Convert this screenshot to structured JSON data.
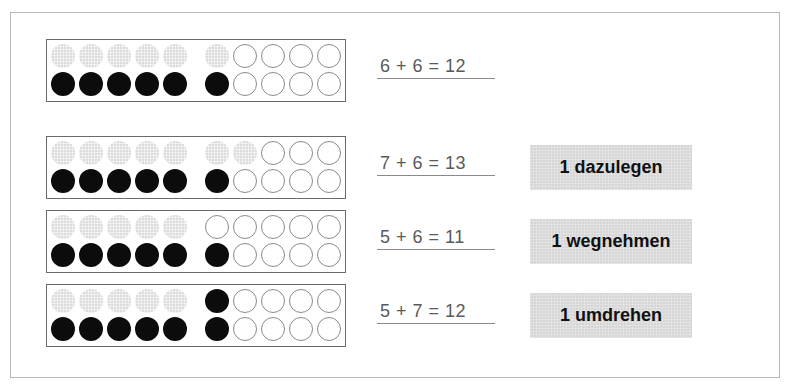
{
  "diagram": {
    "type": "twenty-frame addition exercise",
    "colors": {
      "black_counter": "#0c0c0c",
      "grey_counter": "#dcdcdc",
      "empty_counter": "#ffffff",
      "label_background": "#d6d6d6"
    },
    "rows": [
      {
        "top_row": [
          "grey",
          "grey",
          "grey",
          "grey",
          "grey",
          "grey",
          "empty",
          "empty",
          "empty",
          "empty"
        ],
        "bottom_row": [
          "black",
          "black",
          "black",
          "black",
          "black",
          "black",
          "empty",
          "empty",
          "empty",
          "empty"
        ],
        "equation": "6 + 6 = 12",
        "label": null
      },
      {
        "top_row": [
          "grey",
          "grey",
          "grey",
          "grey",
          "grey",
          "grey",
          "grey",
          "empty",
          "empty",
          "empty"
        ],
        "bottom_row": [
          "black",
          "black",
          "black",
          "black",
          "black",
          "black",
          "empty",
          "empty",
          "empty",
          "empty"
        ],
        "equation": "7 + 6 = 13",
        "label": "1 dazulegen"
      },
      {
        "top_row": [
          "grey",
          "grey",
          "grey",
          "grey",
          "grey",
          "empty",
          "empty",
          "empty",
          "empty",
          "empty"
        ],
        "bottom_row": [
          "black",
          "black",
          "black",
          "black",
          "black",
          "black",
          "empty",
          "empty",
          "empty",
          "empty"
        ],
        "equation": "5 + 6 = 11",
        "label": "1 wegnehmen"
      },
      {
        "top_row": [
          "grey",
          "grey",
          "grey",
          "grey",
          "grey",
          "black",
          "empty",
          "empty",
          "empty",
          "empty"
        ],
        "bottom_row": [
          "black",
          "black",
          "black",
          "black",
          "black",
          "black",
          "empty",
          "empty",
          "empty",
          "empty"
        ],
        "equation": "5 + 7 = 12",
        "label": "1 umdrehen"
      }
    ]
  }
}
